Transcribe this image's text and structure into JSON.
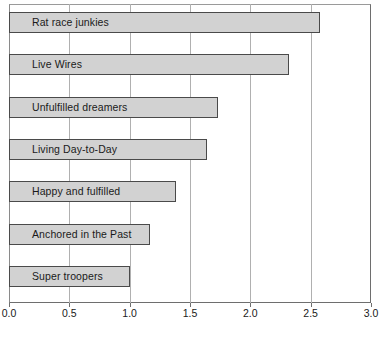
{
  "chart_data": {
    "type": "bar",
    "orientation": "horizontal",
    "title": "",
    "subtitle": "",
    "xlabel": "",
    "ylabel": "",
    "categories": [
      "Rat race junkies",
      "Live Wires",
      "Unfulfilled dreamers",
      "Living Day-to-Day",
      "Happy and fulfilled",
      "Anchored in the Past",
      "Super troopers"
    ],
    "values": [
      2.58,
      2.32,
      1.73,
      1.64,
      1.38,
      1.17,
      1.0
    ],
    "xlim": [
      0.0,
      3.0
    ],
    "xticks": [
      0.0,
      0.5,
      1.0,
      1.5,
      2.0,
      2.5,
      3.0
    ],
    "xtick_labels": [
      "0.0",
      "0.5",
      "1.0",
      "1.5",
      "2.0",
      "2.5",
      "3.0"
    ],
    "grid": "vertical",
    "legend": "none",
    "bar_fill_color": "#d2d2d2",
    "bar_border_color": "#4a4a4a",
    "gridline_color": "#b0b0b0",
    "axis_color": "#6e6e6e",
    "background_color": "#ffffff",
    "text_color": "#1a1a1a"
  }
}
